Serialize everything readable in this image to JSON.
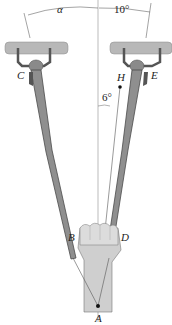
{
  "diagram": {
    "type": "engineering-statics-figure",
    "labels": {
      "alpha": "α",
      "right_angle": "10°",
      "small_angle": "6°",
      "C": "C",
      "E": "E",
      "H": "H",
      "B": "B",
      "D": "D",
      "A": "A"
    },
    "colors": {
      "bar": "#b5b5b5",
      "bar_dark": "#707070",
      "rod": "#8a8a8a",
      "rod_dark": "#4a4a4a",
      "hand": "#d6d6d6",
      "hand_shade": "#b8b8b8",
      "line": "#555555",
      "vertical": "#999999"
    }
  }
}
